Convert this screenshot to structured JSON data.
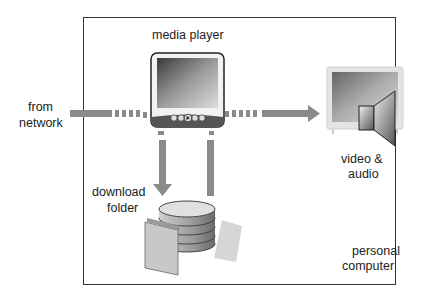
{
  "diagram": {
    "boundary_label": "personal computer",
    "labels": {
      "media_player": "media player",
      "from_network_1": "from",
      "from_network_2": "network",
      "download_folder_1": "download",
      "download_folder_2": "folder",
      "video_audio_1": "video &",
      "video_audio_2": "audio",
      "personal_computer_1": "personal",
      "personal_computer_2": "computer"
    },
    "nodes": [
      "network",
      "media player",
      "download folder",
      "video & audio output"
    ],
    "edges": [
      {
        "from": "network",
        "to": "media player",
        "style": "solid then dashed"
      },
      {
        "from": "media player",
        "to": "video & audio",
        "style": "dashed then solid arrow"
      },
      {
        "from": "media player",
        "to": "download folder",
        "style": "dashed then solid arrow"
      },
      {
        "from": "download folder",
        "to": "media player",
        "style": "solid then dashed"
      }
    ],
    "colors": {
      "arrow": "#8a8a8a",
      "border": "#333333"
    }
  }
}
